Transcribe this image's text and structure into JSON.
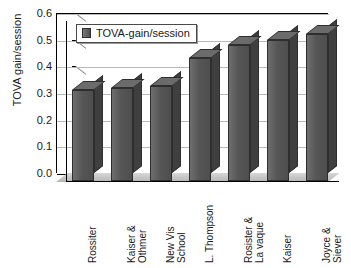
{
  "chart_data": {
    "type": "bar",
    "title": "",
    "xlabel": "",
    "ylabel": "TOVA gain/session",
    "ylim": [
      0.0,
      0.6
    ],
    "ytick_step": 0.1,
    "ytick_labels": [
      "0.6",
      "0.5",
      "0.4",
      "0.3",
      "0.2",
      "0.1",
      "0.0"
    ],
    "grid": true,
    "legend_position": "top-left-inside",
    "style": "3d-column",
    "series": [
      {
        "name": "TOVA-gain/session",
        "values": [
          0.34,
          0.35,
          0.355,
          0.46,
          0.51,
          0.53,
          0.55
        ]
      }
    ],
    "categories": [
      "Rossiter",
      "Kaiser &\nOthmer",
      "New Vis\nSchool",
      "L. Thompson",
      "Rosister &\nLa vaque",
      "Kaiser",
      "Joyce &\nSiever"
    ]
  },
  "legend": {
    "label": "TOVA-gain/session",
    "swatch_name": "series-color-swatch"
  },
  "colors": {
    "bar_front": "#565656",
    "bar_top": "#6b6b6b",
    "bar_side": "#3f3f3f",
    "bar_outline": "#2e2e2e",
    "gridline": "#b9b9b9",
    "axis": "#000000",
    "floor": "#c9c9c9",
    "background": "#ffffff",
    "text": "#1a1a1a"
  }
}
